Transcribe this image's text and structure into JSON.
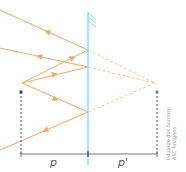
{
  "diagram": {
    "type": "plane-mirror-image-formation",
    "colors": {
      "ray": "#f2a86a",
      "ray_virtual": "#f5c9a0",
      "mirror": "#7fe3e8",
      "dimension": "#777777",
      "guide": "#555555"
    },
    "object_point": {
      "x": 22,
      "y": 83
    },
    "image_point": {
      "x": 155,
      "y": 83
    },
    "mirror": {
      "x": 88,
      "y_top": 12,
      "y_bottom": 165,
      "hatch_side": "right"
    },
    "reflection_points": [
      {
        "x": 88,
        "y": 50
      },
      {
        "x": 88,
        "y": 67
      },
      {
        "x": 88,
        "y": 112
      }
    ],
    "reflected_ray_ends": [
      {
        "x": 0,
        "y": 10
      },
      {
        "x": 0,
        "y": 48
      },
      {
        "x": 0,
        "y": 150
      }
    ],
    "labels": {
      "object_distance": "p",
      "image_distance": "p'"
    },
    "credit": {
      "line1": "Eduardo dos Santos/",
      "line2": "ASC Imagens"
    }
  }
}
